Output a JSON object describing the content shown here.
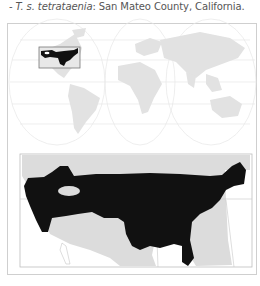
{
  "caption": {
    "prefix": "- ",
    "taxon": "T. s. tetrataenia",
    "sep": ":",
    "location": " San Mateo County, California."
  },
  "maps": {
    "world_map": {
      "label": "world-map",
      "highlight_region": "North America (USA)"
    },
    "detail_map": {
      "label": "north-america-range-map",
      "range_color": "#111111",
      "land_color": "#dcdcdc"
    }
  },
  "colors": {
    "range": "#111111",
    "land": "#dddddd",
    "grid": "#e4e4e4",
    "border": "#cfcfcf"
  }
}
